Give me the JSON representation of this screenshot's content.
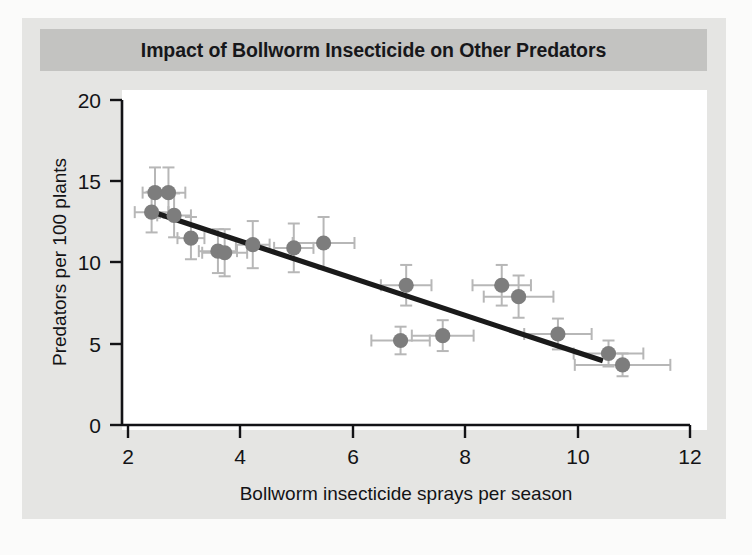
{
  "figure": {
    "title": "Impact of Bollworm Insecticide on Other Predators",
    "background_color": "#e5e5e3",
    "title_band_color": "#c3c3c1",
    "plot_background_color": "#ffffff",
    "page_margin_color": "#fbfbfa"
  },
  "chart_data": {
    "type": "scatter",
    "title": "Impact of Bollworm Insecticide on Other Predators",
    "xlabel": "Bollworm insecticide sprays per season",
    "ylabel": "Predators per 100 plants",
    "xlim": [
      2,
      12
    ],
    "ylim": [
      0,
      20
    ],
    "xticks": [
      2,
      4,
      6,
      8,
      10,
      12
    ],
    "yticks": [
      0,
      5,
      10,
      15,
      20
    ],
    "xtick_labels": [
      "2",
      "4",
      "6",
      "8",
      "10",
      "12"
    ],
    "ytick_labels": [
      "0",
      "5",
      "10",
      "15",
      "20"
    ],
    "grid": false,
    "legend": null,
    "marker_color": "#7d7d7d",
    "errorbar_color": "#b7b7b7",
    "trendline_color": "#1a1a1a",
    "points": [
      {
        "x": 2.42,
        "y": 13.1,
        "xerr": 0.3,
        "yerr": 1.25
      },
      {
        "x": 2.48,
        "y": 14.3,
        "xerr": 0.22,
        "yerr": 1.55
      },
      {
        "x": 2.72,
        "y": 14.3,
        "xerr": 0.3,
        "yerr": 1.55
      },
      {
        "x": 2.82,
        "y": 12.9,
        "xerr": 0.3,
        "yerr": 1.35
      },
      {
        "x": 3.12,
        "y": 11.5,
        "xerr": 0.24,
        "yerr": 1.3
      },
      {
        "x": 3.6,
        "y": 10.7,
        "xerr": 0.34,
        "yerr": 1.35
      },
      {
        "x": 3.72,
        "y": 10.6,
        "xerr": 0.4,
        "yerr": 1.45
      },
      {
        "x": 4.22,
        "y": 11.1,
        "xerr": 0.3,
        "yerr": 1.45
      },
      {
        "x": 4.95,
        "y": 10.9,
        "xerr": 0.35,
        "yerr": 1.5
      },
      {
        "x": 5.48,
        "y": 11.2,
        "xerr": 0.55,
        "yerr": 1.6
      },
      {
        "x": 6.85,
        "y": 5.2,
        "xerr": 0.52,
        "yerr": 0.85
      },
      {
        "x": 6.95,
        "y": 8.6,
        "xerr": 0.45,
        "yerr": 1.25
      },
      {
        "x": 7.6,
        "y": 5.5,
        "xerr": 0.55,
        "yerr": 0.95
      },
      {
        "x": 8.65,
        "y": 8.6,
        "xerr": 0.52,
        "yerr": 1.25
      },
      {
        "x": 8.95,
        "y": 7.9,
        "xerr": 0.62,
        "yerr": 1.3
      },
      {
        "x": 9.65,
        "y": 5.6,
        "xerr": 0.6,
        "yerr": 0.95
      },
      {
        "x": 10.55,
        "y": 4.4,
        "xerr": 0.62,
        "yerr": 0.8
      },
      {
        "x": 10.8,
        "y": 3.7,
        "xerr": 0.85,
        "yerr": 0.7
      }
    ],
    "trendline": {
      "x_start": 2.4,
      "y_start": 13.15,
      "x_end": 10.45,
      "y_end": 3.95
    }
  }
}
